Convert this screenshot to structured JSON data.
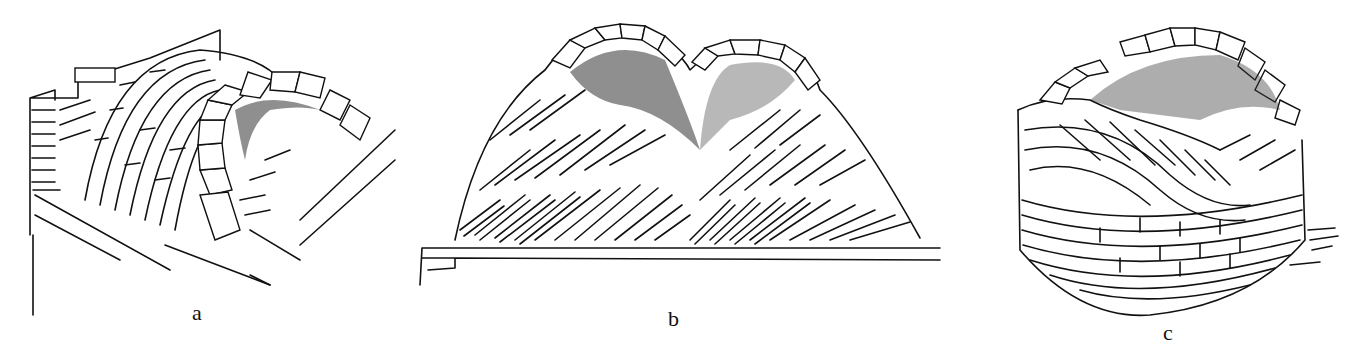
{
  "figure": {
    "panels": [
      {
        "id": "a",
        "label": "a",
        "subject": "barrel vault with voussoir arch ring on brick wall"
      },
      {
        "id": "b",
        "label": "b",
        "subject": "twin-domed vault with herringbone (pitched) brick courses on base"
      },
      {
        "id": "c",
        "label": "c",
        "subject": "circular vault with inclined herringbone brick courses"
      }
    ]
  },
  "colors": {
    "ink": "#111111",
    "paper": "#ffffff"
  }
}
